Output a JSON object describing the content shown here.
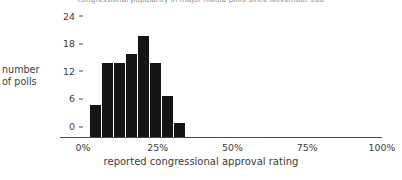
{
  "chart_data": {
    "type": "bar",
    "title": "congressional popularity in major media polls since November 200",
    "xlabel": "reported congressional approval rating",
    "ylabel": "number of polls",
    "ylabel_lines": [
      "number",
      "of polls"
    ],
    "categories": [
      "2.5%",
      "6.5%",
      "10.5%",
      "14.5%",
      "18.5%",
      "22.5%",
      "26.5%",
      "30.5%"
    ],
    "bin_starts": [
      2.5,
      6.5,
      10.5,
      14.5,
      18.5,
      22.5,
      26.5,
      30.5
    ],
    "bin_width": 4,
    "values": [
      7,
      16,
      16,
      18,
      22,
      16,
      9,
      3
    ],
    "xlim": [
      0,
      100
    ],
    "ylim": [
      0,
      25.2
    ],
    "xticks": [
      0,
      25,
      50,
      75,
      100
    ],
    "xtick_labels": [
      "0%",
      "25%",
      "50%",
      "75%",
      "100%"
    ],
    "yticks": [
      0,
      6,
      12,
      18,
      24
    ],
    "ytick_labels": [
      "0",
      "6",
      "12",
      "18",
      "24"
    ],
    "grid": false,
    "legend": false,
    "bar_color": "#151515",
    "axis_color": "#4a4a4a",
    "text_color": "#3b3b3b",
    "background": "#ffffff"
  }
}
